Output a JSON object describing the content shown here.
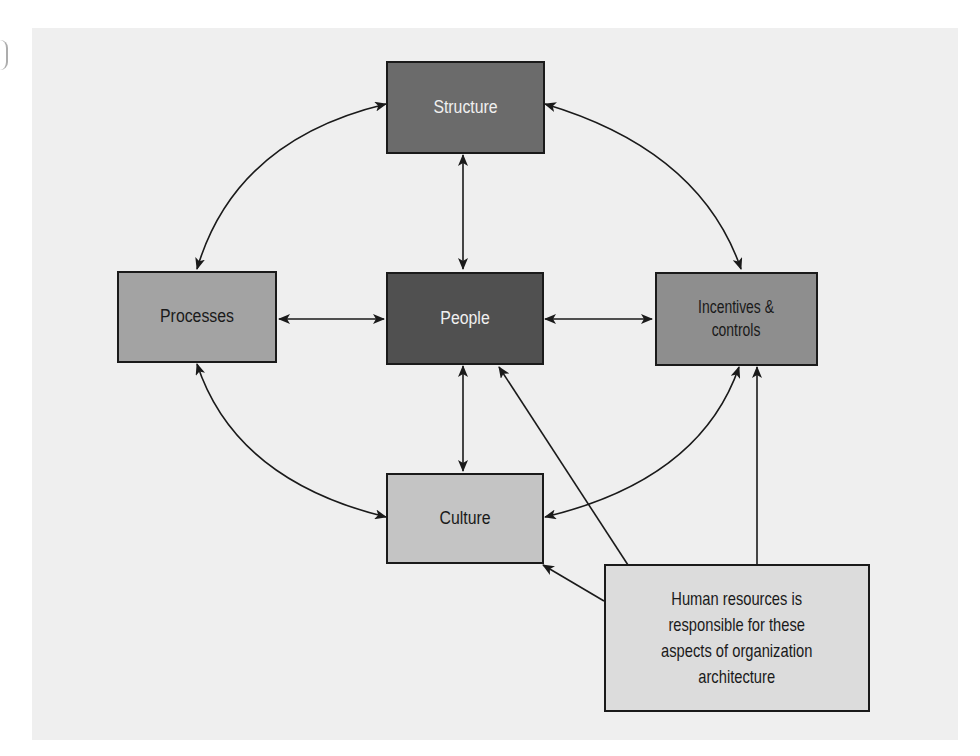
{
  "figure": {
    "background_color": "#efefef",
    "nodes": {
      "structure": {
        "label": "Structure",
        "fill": "#6b6b6b",
        "text_color": "#f0f0f0"
      },
      "processes": {
        "label": "Processes",
        "fill": "#a3a3a3",
        "text_color": "#1a1a1a"
      },
      "people": {
        "label": "People",
        "fill": "#505050",
        "text_color": "#f0f0f0"
      },
      "incentives": {
        "label": "Incentives & controls",
        "line1": "Incentives &",
        "line2": "controls",
        "fill": "#8e8e8e",
        "text_color": "#1a1a1a"
      },
      "culture": {
        "label": "Culture",
        "fill": "#c4c4c4",
        "text_color": "#1a1a1a"
      },
      "hr_note": {
        "label": "Human resources is responsible for these aspects of organization architecture",
        "lines": [
          "Human resources is",
          "responsible for these",
          "aspects of organization",
          "architecture"
        ],
        "fill": "#dcdcdc",
        "text_color": "#1a1a1a"
      }
    },
    "connections": [
      {
        "from": "Processes",
        "to": "Structure",
        "type": "curved",
        "bidirectional": true
      },
      {
        "from": "Structure",
        "to": "Incentives & controls",
        "type": "curved",
        "bidirectional": true
      },
      {
        "from": "Processes",
        "to": "Culture",
        "type": "curved",
        "bidirectional": true
      },
      {
        "from": "Incentives & controls",
        "to": "Culture",
        "type": "curved",
        "bidirectional": true
      },
      {
        "from": "Structure",
        "to": "People",
        "type": "straight",
        "bidirectional": true
      },
      {
        "from": "Processes",
        "to": "People",
        "type": "straight",
        "bidirectional": true
      },
      {
        "from": "People",
        "to": "Incentives & controls",
        "type": "straight",
        "bidirectional": true
      },
      {
        "from": "People",
        "to": "Culture",
        "type": "straight",
        "bidirectional": true
      },
      {
        "from": "Human resources",
        "to": "People",
        "type": "straight",
        "bidirectional": false
      },
      {
        "from": "Human resources",
        "to": "Incentives & controls",
        "type": "straight",
        "bidirectional": false
      },
      {
        "from": "Human resources",
        "to": "Culture",
        "type": "straight",
        "bidirectional": false
      }
    ]
  }
}
